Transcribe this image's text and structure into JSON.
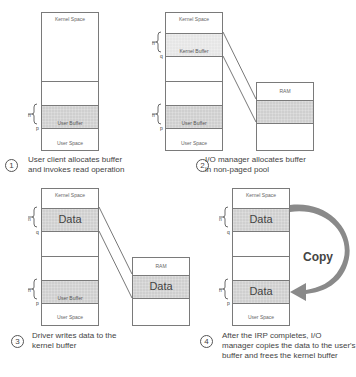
{
  "panels": [
    {
      "step": "1",
      "caption_line1": "User client allocates buffer",
      "caption_line2": "and invokes read operation",
      "memory": {
        "kernel_label": "Kernel Space",
        "user_label": "User Space",
        "user_buffer_label": "User Buffer"
      },
      "brace_n": "n",
      "pointer_p": "p"
    },
    {
      "step": "2",
      "caption_line1": "I/O manager allocates buffer",
      "caption_line2": "in non-paged pool",
      "memory": {
        "kernel_label": "Kernel Space",
        "kernel_buffer_label": "Kernel Buffer",
        "user_label": "User Space",
        "user_buffer_label": "User Buffer"
      },
      "ram_label": "RAM",
      "brace_n": "n",
      "pointer_q": "q",
      "pointer_p": "p"
    },
    {
      "step": "3",
      "caption_line1": "Driver writes data to the",
      "caption_line2": "kernel buffer",
      "memory": {
        "kernel_label": "Kernel Space",
        "kernel_data_label": "Data",
        "user_label": "User Space",
        "user_buffer_label": "User Buffer"
      },
      "ram_label": "RAM",
      "ram_data_label": "Data",
      "brace_n": "n",
      "pointer_q": "q",
      "pointer_p": "p"
    },
    {
      "step": "4",
      "caption_line1": "After the IRP completes, I/O",
      "caption_line2": "manager copies the data to the user's",
      "caption_line3": "buffer and frees the kernel buffer",
      "memory": {
        "kernel_label": "Kernel Space",
        "kernel_data_label": "Data",
        "user_label": "User Space",
        "user_data_label": "Data"
      },
      "copy_label": "Copy",
      "brace_n": "n",
      "pointer_q": "q",
      "pointer_p": "p"
    }
  ],
  "colors": {
    "buffer_fill": "#cfcfcf",
    "border": "#7a7a7a",
    "copy_arrow": "#8a8a8a"
  }
}
